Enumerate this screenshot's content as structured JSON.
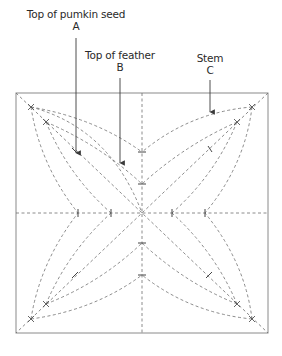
{
  "labels": {
    "a": {
      "title": "Top of pumkin seed",
      "letter": "A"
    },
    "b": {
      "title": "Top of feather",
      "letter": "B"
    },
    "c": {
      "title": "Stem",
      "letter": "C"
    }
  },
  "colors": {
    "frame": "#8a8a8a",
    "dash": "#6e6e6e",
    "arrow": "#3a3a3a",
    "text": "#2a2a2a"
  },
  "geometry": {
    "square": {
      "x1": 16,
      "y1": 93,
      "x2": 268,
      "y2": 333
    },
    "center": {
      "x": 142,
      "y": 213
    },
    "ticks": {
      "horizontal_x": [
        78,
        111,
        172,
        205
      ],
      "vertical_y": [
        152,
        184,
        243,
        275
      ]
    },
    "arrows": [
      {
        "label": "A",
        "x": 76,
        "y_from": 38,
        "y_to": 153
      },
      {
        "label": "B",
        "x": 120,
        "y_from": 78,
        "y_to": 163
      },
      {
        "label": "C",
        "x": 210,
        "y_from": 80,
        "y_to": 112
      }
    ]
  }
}
